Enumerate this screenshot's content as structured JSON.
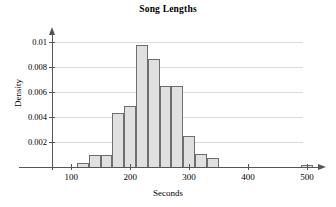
{
  "chart_data": {
    "type": "bar",
    "title": "Song Lengths",
    "xlabel": "Seconds",
    "ylabel": "Density",
    "xlim": [
      60,
      520
    ],
    "ylim": [
      0,
      0.0108
    ],
    "grid": true,
    "legend": null,
    "bin_width": 20,
    "xticks": [
      100,
      200,
      300,
      400,
      500
    ],
    "xtick_labels": [
      "100",
      "200",
      "300",
      "400",
      "500"
    ],
    "yticks": [
      0.002,
      0.004,
      0.006,
      0.008,
      0.01
    ],
    "ytick_labels": [
      "0.002",
      "0.004",
      "0.006",
      "0.008",
      "0.01"
    ],
    "bins": [
      {
        "start": 110,
        "end": 130,
        "density": 0.0004
      },
      {
        "start": 130,
        "end": 150,
        "density": 0.001
      },
      {
        "start": 150,
        "end": 170,
        "density": 0.001
      },
      {
        "start": 170,
        "end": 190,
        "density": 0.0044
      },
      {
        "start": 190,
        "end": 210,
        "density": 0.0049
      },
      {
        "start": 210,
        "end": 230,
        "density": 0.0098
      },
      {
        "start": 230,
        "end": 250,
        "density": 0.0087
      },
      {
        "start": 250,
        "end": 270,
        "density": 0.0065
      },
      {
        "start": 270,
        "end": 290,
        "density": 0.0065
      },
      {
        "start": 290,
        "end": 310,
        "density": 0.0025
      },
      {
        "start": 310,
        "end": 330,
        "density": 0.0011
      },
      {
        "start": 330,
        "end": 350,
        "density": 0.0008
      },
      {
        "start": 490,
        "end": 510,
        "density": 0.0001
      }
    ],
    "bin_labels": [
      "110-130",
      "130-150",
      "150-170",
      "170-190",
      "190-210",
      "210-230",
      "230-250",
      "250-270",
      "270-290",
      "290-310",
      "310-330",
      "330-350",
      "490-510"
    ],
    "colors": {
      "bar_fill": "#e0e0e0",
      "bar_edge": "#6e6e6e",
      "axis": "#555555",
      "grid": "#dcdcdc",
      "text": "#000000",
      "background": "#ffffff"
    }
  }
}
